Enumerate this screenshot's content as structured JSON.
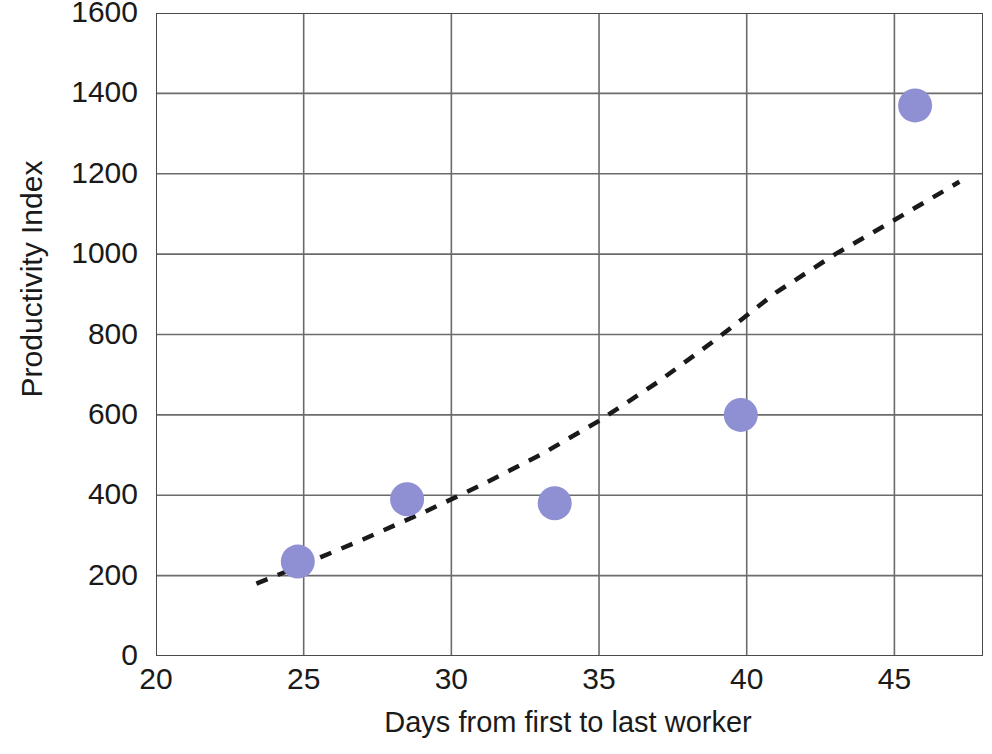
{
  "chart_data": {
    "type": "scatter",
    "title": "",
    "subtitle": "",
    "xlabel": "Days from first to last worker",
    "ylabel": "Productivity Index",
    "xlim": [
      20,
      48
    ],
    "ylim": [
      0,
      1600
    ],
    "xticks": [
      20,
      25,
      30,
      35,
      40,
      45
    ],
    "xtick_labels": [
      "20",
      "25",
      "30",
      "35",
      "40",
      "45"
    ],
    "yticks": [
      0,
      200,
      400,
      600,
      800,
      1000,
      1200,
      1400,
      1600
    ],
    "ytick_labels": [
      "0",
      "200",
      "400",
      "600",
      "800",
      "1000",
      "1200",
      "1400",
      "1600"
    ],
    "grid": true,
    "grid_color": "#6b6b6b",
    "legend": false,
    "legend_position": "none",
    "marker_color": "#8f8fd3",
    "marker_shape": "circle",
    "marker_size_px": 34,
    "trendline": {
      "style": "dashed",
      "color": "#1a1a1a",
      "label": "",
      "x_start": 23.4,
      "x_end": 47.2,
      "y_start": 180,
      "y_end": 1180,
      "points": [
        {
          "x": 23.4,
          "y": 180
        },
        {
          "x": 25.0,
          "y": 228
        },
        {
          "x": 27.0,
          "y": 290
        },
        {
          "x": 29.0,
          "y": 355
        },
        {
          "x": 31.0,
          "y": 425
        },
        {
          "x": 33.0,
          "y": 500
        },
        {
          "x": 35.0,
          "y": 585
        },
        {
          "x": 37.0,
          "y": 682
        },
        {
          "x": 39.0,
          "y": 790
        },
        {
          "x": 41.0,
          "y": 905
        },
        {
          "x": 43.0,
          "y": 1000
        },
        {
          "x": 45.0,
          "y": 1085
        },
        {
          "x": 47.2,
          "y": 1180
        }
      ]
    },
    "series": [
      {
        "name": "Projects",
        "points": [
          {
            "x": 24.8,
            "y": 235
          },
          {
            "x": 28.5,
            "y": 390
          },
          {
            "x": 33.5,
            "y": 380
          },
          {
            "x": 39.8,
            "y": 600
          },
          {
            "x": 45.7,
            "y": 1370
          }
        ]
      }
    ]
  }
}
